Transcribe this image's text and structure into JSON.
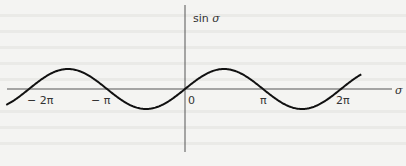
{
  "chart_data": {
    "type": "line",
    "title": "",
    "function": "sin σ",
    "xlabel": "σ",
    "ylabel": "sin σ",
    "x_ticks": [
      "− 2π",
      "− π",
      "0",
      "π",
      "2π"
    ],
    "x_tick_values": [
      -6.2832,
      -3.1416,
      0,
      3.1416,
      6.2832
    ],
    "xlim": [
      -7.2,
      6.9
    ],
    "ylim": [
      -1,
      1
    ],
    "grid": false,
    "series": [
      {
        "name": "sin σ",
        "expression": "sin(σ)",
        "x_range": [
          -7.2,
          7.1
        ]
      }
    ]
  },
  "axes": {
    "x_label": "σ",
    "y_label_prefix": "sin",
    "y_label_var": "σ",
    "ticks": {
      "neg_2pi": "− 2π",
      "neg_pi": "− π",
      "zero": "0",
      "pi": "π",
      "two_pi": "2π"
    }
  }
}
